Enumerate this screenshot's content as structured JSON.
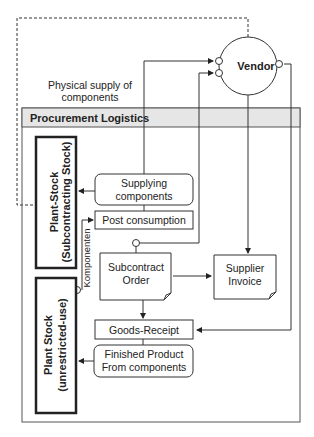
{
  "diagram": {
    "vendor": {
      "label": "Vendor"
    },
    "physical_supply": {
      "line1": "Physical supply of",
      "line2": "components"
    },
    "container": {
      "title": "Procurement Logistics"
    },
    "plant_stock_subcontracting": {
      "line1": "Plant-Stock",
      "line2": "(Subcontracting Stock)"
    },
    "plant_stock_unrestricted": {
      "line1": "Plant Stock",
      "line2": "(unrestricted-use)"
    },
    "supplying_components": {
      "line1": "Supplying",
      "line2": "components"
    },
    "post_consumption": {
      "label": "Post consumption"
    },
    "komponenten": {
      "label": "Komponenten"
    },
    "subcontract_order": {
      "line1": "Subcontract",
      "line2": "Order"
    },
    "supplier_invoice": {
      "line1": "Supplier",
      "line2": "Invoice"
    },
    "goods_receipt": {
      "label": "Goods-Receipt"
    },
    "finished_product": {
      "line1": "Finished Product",
      "line2": "From components"
    }
  }
}
